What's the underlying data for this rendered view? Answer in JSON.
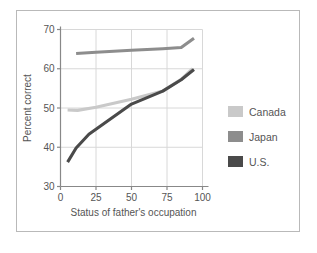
{
  "chart_data": {
    "type": "line",
    "title": "",
    "xlabel": "Status of father's occupation",
    "ylabel": "Percent correct",
    "xlim": [
      0,
      100
    ],
    "ylim": [
      30,
      70
    ],
    "xticks": [
      0,
      25,
      50,
      75,
      100
    ],
    "yticks": [
      30,
      40,
      50,
      60,
      70
    ],
    "grid": true,
    "legend_position": "right",
    "series": [
      {
        "name": "Canada",
        "color": "#c9c9c9",
        "x": [
          5,
          12,
          25,
          50,
          72,
          85,
          93
        ],
        "y": [
          49.5,
          49.4,
          50.2,
          52.2,
          54.3,
          57.3,
          60.0
        ]
      },
      {
        "name": "Japan",
        "color": "#8d8d8d",
        "x": [
          11,
          25,
          50,
          72,
          85,
          94
        ],
        "y": [
          63.9,
          64.2,
          64.7,
          65.1,
          65.4,
          67.8
        ]
      },
      {
        "name": "U.S.",
        "color": "#4a4a4a",
        "x": [
          5,
          11,
          20,
          50,
          72,
          85,
          94
        ],
        "y": [
          36.2,
          39.8,
          43.3,
          51.0,
          54.3,
          57.2,
          59.8
        ]
      }
    ]
  },
  "axes": {
    "ylabel": "Percent correct",
    "xlabel": "Status of father's occupation",
    "ytick_labels": [
      "30",
      "40",
      "50",
      "60",
      "70"
    ],
    "xtick_labels": [
      "0",
      "25",
      "50",
      "75",
      "100"
    ]
  },
  "legend": {
    "items": [
      {
        "label": "Canada",
        "color": "#c9c9c9"
      },
      {
        "label": "Japan",
        "color": "#8d8d8d"
      },
      {
        "label": "U.S.",
        "color": "#4a4a4a"
      }
    ]
  },
  "colors": {
    "frame_border": "#b9b9b9",
    "grid": "#d8d8d8",
    "axis": "#888888",
    "text": "#555555",
    "background": "#ffffff"
  }
}
